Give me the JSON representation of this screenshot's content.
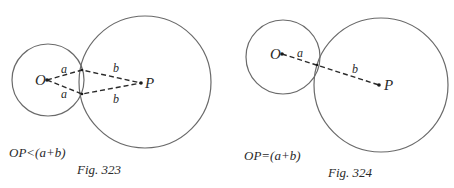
{
  "figures": [
    {
      "id": "fig323",
      "caption": "Fig. 323",
      "condition": "OP<(a+b)",
      "point_O": "O",
      "point_P": "P",
      "segment_labels": {
        "a_upper": "a",
        "a_lower": "a",
        "b_upper": "b",
        "b_lower": "b"
      },
      "circle_O": {
        "cx": 48,
        "cy": 80,
        "r": 36
      },
      "circle_P": {
        "cx": 145,
        "cy": 82,
        "r": 66
      },
      "O": [
        47,
        80
      ],
      "P": [
        141,
        83
      ],
      "intersections": [
        [
          82,
          70
        ],
        [
          82,
          94
        ]
      ]
    },
    {
      "id": "fig324",
      "caption": "Fig. 324",
      "condition": "OP=(a+b)",
      "point_O": "O",
      "point_P": "P",
      "segment_labels": {
        "a": "a",
        "b": "b"
      },
      "circle_O": {
        "cx": 283,
        "cy": 57,
        "r": 37
      },
      "circle_P": {
        "cx": 381,
        "cy": 85,
        "r": 67
      },
      "O": [
        282,
        54
      ],
      "P": [
        379,
        85
      ],
      "tangent_point": [
        317,
        66
      ]
    }
  ]
}
